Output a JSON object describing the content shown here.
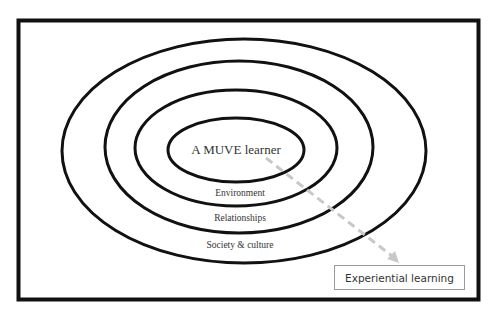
{
  "diagram": {
    "center_label": "A MUVE learner",
    "rings": [
      {
        "label": "Environment"
      },
      {
        "label": "Relationships"
      },
      {
        "label": "Society & culture"
      }
    ],
    "arrow_target_label": "Experiential learning",
    "colors": {
      "stroke": "#111111",
      "arrow": "#c8c8c8",
      "box_border": "#9a9a9a",
      "text": "#333333"
    }
  }
}
